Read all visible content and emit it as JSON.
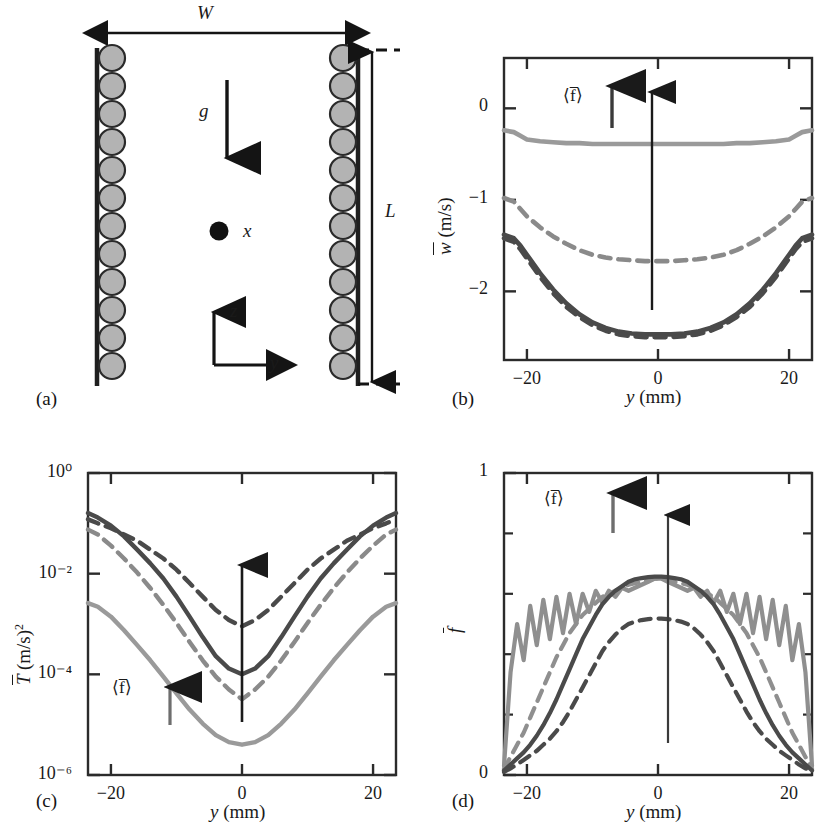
{
  "figure": {
    "panels": [
      {
        "id": "a",
        "label": "(a)"
      },
      {
        "id": "b",
        "label": "(b)"
      },
      {
        "id": "c",
        "label": "(c)"
      },
      {
        "id": "d",
        "label": "(d)"
      }
    ]
  },
  "schematic": {
    "width_label": "W",
    "length_label": "L",
    "gravity_label": "g",
    "axis_x_label": "x",
    "axis_y_label": "y",
    "axis_z_label": "z",
    "wall_particle_count": 12,
    "wall_color": "#b3b3b3",
    "wall_line_color": "#1a1a1a"
  },
  "annotation": {
    "flux_symbol": "⟨f‾⟩",
    "flux_symbol_left": "⟨",
    "flux_symbol_core": "f",
    "flux_symbol_right": "⟩"
  },
  "colors": {
    "dark": "#4a4a4a",
    "mid": "#6e6e6e",
    "light": "#9a9a9a",
    "lighter": "#a8a8a8",
    "axis": "#2b2b2b",
    "arrow": "#111111"
  },
  "chart_data": [
    {
      "panel": "b",
      "type": "line",
      "title": "",
      "xlabel": "y (mm)",
      "ylabel": "w̄ (m/s)",
      "xlim": [
        -23.5,
        23.5
      ],
      "ylim": [
        -2.75,
        0.55
      ],
      "xticks": [
        -20,
        0,
        20
      ],
      "xticklabels": [
        "−20",
        "0",
        "20"
      ],
      "yticks": [
        0,
        -1,
        -2
      ],
      "yticklabels": [
        "0",
        "−1",
        "−2"
      ],
      "grid": false,
      "legend": "none",
      "annotation": "⟨f‾⟩ increases upward",
      "x": [
        -23.5,
        -22,
        -21,
        -20,
        -18,
        -16,
        -14,
        -12,
        -10,
        -8,
        -6,
        -4,
        -2,
        0,
        2,
        4,
        6,
        8,
        10,
        12,
        14,
        16,
        18,
        20,
        21,
        22,
        23.5
      ],
      "series": [
        {
          "name": "lowest flux (light solid)",
          "style": "solid",
          "color": "#9a9a9a",
          "values": [
            -0.24,
            -0.26,
            -0.3,
            -0.34,
            -0.36,
            -0.37,
            -0.38,
            -0.38,
            -0.39,
            -0.39,
            -0.39,
            -0.39,
            -0.39,
            -0.39,
            -0.39,
            -0.39,
            -0.39,
            -0.39,
            -0.39,
            -0.38,
            -0.38,
            -0.37,
            -0.36,
            -0.34,
            -0.3,
            -0.26,
            -0.24
          ]
        },
        {
          "name": "mid flux (light dashed)",
          "style": "dashed",
          "color": "#8a8a8a",
          "values": [
            -0.98,
            -1.02,
            -1.1,
            -1.18,
            -1.3,
            -1.4,
            -1.48,
            -1.55,
            -1.6,
            -1.63,
            -1.65,
            -1.66,
            -1.67,
            -1.67,
            -1.67,
            -1.66,
            -1.65,
            -1.63,
            -1.6,
            -1.55,
            -1.48,
            -1.4,
            -1.3,
            -1.18,
            -1.1,
            -1.02,
            -0.98
          ]
        },
        {
          "name": "high flux (dark solid)",
          "style": "solid",
          "color": "#4a4a4a",
          "values": [
            -1.38,
            -1.42,
            -1.5,
            -1.6,
            -1.8,
            -1.98,
            -2.13,
            -2.25,
            -2.34,
            -2.4,
            -2.44,
            -2.46,
            -2.47,
            -2.47,
            -2.47,
            -2.46,
            -2.44,
            -2.4,
            -2.34,
            -2.25,
            -2.13,
            -1.98,
            -1.8,
            -1.6,
            -1.5,
            -1.42,
            -1.38
          ]
        },
        {
          "name": "highest flux (dark dashed)",
          "style": "dashed",
          "color": "#4a4a4a",
          "values": [
            -1.42,
            -1.46,
            -1.54,
            -1.64,
            -1.84,
            -2.02,
            -2.17,
            -2.28,
            -2.37,
            -2.43,
            -2.47,
            -2.49,
            -2.5,
            -2.5,
            -2.5,
            -2.49,
            -2.47,
            -2.43,
            -2.37,
            -2.28,
            -2.17,
            -2.02,
            -1.84,
            -1.64,
            -1.54,
            -1.46,
            -1.42
          ]
        }
      ]
    },
    {
      "panel": "c",
      "type": "line",
      "title": "",
      "xlabel": "y (mm)",
      "ylabel": "T̄ (m/s)²",
      "yscale": "log",
      "xlim": [
        -23.5,
        23.5
      ],
      "ylim": [
        1e-06,
        1.0
      ],
      "xticks": [
        -20,
        0,
        20
      ],
      "xticklabels": [
        "−20",
        "0",
        "20"
      ],
      "yticks": [
        1.0,
        0.01,
        0.0001,
        1e-06
      ],
      "yticklabels": [
        "10⁰",
        "10⁻²",
        "10⁻⁴",
        "10⁻⁶"
      ],
      "grid": false,
      "legend": "none",
      "annotation": "⟨f‾⟩ increases upward",
      "x": [
        -23.5,
        -22,
        -20,
        -18,
        -16,
        -14,
        -12,
        -10,
        -8,
        -6,
        -4,
        -2,
        0,
        2,
        4,
        6,
        8,
        10,
        12,
        14,
        16,
        18,
        20,
        22,
        23.5
      ],
      "series": [
        {
          "name": "highest flux (dark dashed)",
          "style": "dashed",
          "color": "#4a4a4a",
          "values": [
            0.12,
            0.1,
            0.08,
            0.06,
            0.045,
            0.03,
            0.02,
            0.012,
            0.0065,
            0.0035,
            0.0019,
            0.0012,
            0.0009,
            0.0012,
            0.0019,
            0.0035,
            0.0065,
            0.012,
            0.02,
            0.03,
            0.045,
            0.06,
            0.08,
            0.1,
            0.12
          ]
        },
        {
          "name": "high flux (dark solid)",
          "style": "solid",
          "color": "#4a4a4a",
          "values": [
            0.16,
            0.13,
            0.09,
            0.055,
            0.03,
            0.016,
            0.008,
            0.0035,
            0.0014,
            0.00055,
            0.00023,
            0.00013,
            0.0001,
            0.00013,
            0.00023,
            0.00055,
            0.0014,
            0.0035,
            0.008,
            0.016,
            0.03,
            0.055,
            0.09,
            0.13,
            0.16
          ]
        },
        {
          "name": "mid flux (light dashed)",
          "style": "dashed",
          "color": "#8a8a8a",
          "values": [
            0.075,
            0.06,
            0.036,
            0.02,
            0.0105,
            0.0052,
            0.0024,
            0.00105,
            0.00044,
            0.00019,
            9e-05,
            5e-05,
            3.2e-05,
            5e-05,
            9e-05,
            0.00019,
            0.00044,
            0.00105,
            0.0024,
            0.0052,
            0.0105,
            0.02,
            0.036,
            0.06,
            0.075
          ]
        },
        {
          "name": "lowest flux (light solid)",
          "style": "solid",
          "color": "#9a9a9a",
          "values": [
            0.0026,
            0.0022,
            0.0014,
            0.00075,
            0.00038,
            0.00019,
            9e-05,
            4.2e-05,
            2e-05,
            1.05e-05,
            6.2e-06,
            4.5e-06,
            4e-06,
            4.5e-06,
            6.2e-06,
            1.05e-05,
            2e-05,
            4.2e-05,
            9e-05,
            0.00019,
            0.00038,
            0.00075,
            0.0014,
            0.0022,
            0.0026
          ]
        }
      ]
    },
    {
      "panel": "d",
      "type": "line",
      "title": "",
      "xlabel": "y (mm)",
      "ylabel": "f̄",
      "xlim": [
        -23.5,
        23.5
      ],
      "ylim": [
        0,
        1
      ],
      "xticks": [
        -20,
        0,
        20
      ],
      "xticklabels": [
        "−20",
        "0",
        "20"
      ],
      "yticks": [
        0,
        1
      ],
      "yticklabels": [
        "0",
        "1"
      ],
      "yminorticks": [
        0.2,
        0.4,
        0.6,
        0.8
      ],
      "grid": false,
      "legend": "none",
      "annotation": "⟨f‾⟩ increases upward",
      "x": [
        -23.5,
        -22.5,
        -21.5,
        -20.5,
        -19.5,
        -18.5,
        -17.5,
        -16.5,
        -15.5,
        -14.5,
        -13.5,
        -12.5,
        -11.5,
        -10.5,
        -9.5,
        -8.5,
        -7.5,
        -6.5,
        -5.5,
        -4.5,
        -3.5,
        -2.5,
        -1.5,
        -0.5,
        0.5,
        1.5,
        2.5,
        3.5,
        4.5,
        5.5,
        6.5,
        7.5,
        8.5,
        9.5,
        10.5,
        11.5,
        12.5,
        13.5,
        14.5,
        15.5,
        16.5,
        17.5,
        18.5,
        19.5,
        20.5,
        21.5,
        22.5,
        23.5
      ],
      "series": [
        {
          "name": "lowest flux (light solid, oscillating)",
          "style": "solid",
          "color": "#8f8f8f",
          "values": [
            0.03,
            0.34,
            0.5,
            0.38,
            0.56,
            0.43,
            0.58,
            0.45,
            0.59,
            0.47,
            0.6,
            0.5,
            0.6,
            0.54,
            0.61,
            0.57,
            0.61,
            0.59,
            0.62,
            0.61,
            0.62,
            0.63,
            0.64,
            0.65,
            0.65,
            0.64,
            0.63,
            0.62,
            0.61,
            0.62,
            0.59,
            0.61,
            0.57,
            0.61,
            0.54,
            0.6,
            0.5,
            0.6,
            0.47,
            0.59,
            0.45,
            0.58,
            0.43,
            0.56,
            0.38,
            0.5,
            0.34,
            0.03
          ]
        },
        {
          "name": "mid flux (light dashed)",
          "style": "dashed",
          "color": "#8f8f8f",
          "values": [
            0.02,
            0.06,
            0.1,
            0.14,
            0.19,
            0.24,
            0.29,
            0.34,
            0.39,
            0.43,
            0.47,
            0.5,
            0.53,
            0.55,
            0.57,
            0.59,
            0.6,
            0.61,
            0.62,
            0.63,
            0.635,
            0.64,
            0.645,
            0.65,
            0.65,
            0.645,
            0.64,
            0.635,
            0.63,
            0.62,
            0.61,
            0.6,
            0.59,
            0.57,
            0.55,
            0.53,
            0.5,
            0.47,
            0.43,
            0.39,
            0.34,
            0.29,
            0.24,
            0.19,
            0.14,
            0.1,
            0.06,
            0.02
          ]
        },
        {
          "name": "high flux (dark solid)",
          "style": "solid",
          "color": "#4a4a4a",
          "values": [
            0.015,
            0.035,
            0.055,
            0.075,
            0.1,
            0.13,
            0.165,
            0.205,
            0.25,
            0.3,
            0.35,
            0.4,
            0.45,
            0.49,
            0.53,
            0.565,
            0.59,
            0.61,
            0.625,
            0.64,
            0.648,
            0.652,
            0.655,
            0.657,
            0.657,
            0.655,
            0.652,
            0.648,
            0.64,
            0.625,
            0.61,
            0.59,
            0.565,
            0.53,
            0.49,
            0.45,
            0.4,
            0.35,
            0.3,
            0.25,
            0.205,
            0.165,
            0.13,
            0.1,
            0.075,
            0.055,
            0.035,
            0.015
          ]
        },
        {
          "name": "highest flux (dark dashed)",
          "style": "dashed",
          "color": "#4a4a4a",
          "values": [
            0.01,
            0.022,
            0.035,
            0.05,
            0.065,
            0.08,
            0.1,
            0.12,
            0.145,
            0.175,
            0.21,
            0.25,
            0.29,
            0.33,
            0.37,
            0.41,
            0.44,
            0.465,
            0.485,
            0.5,
            0.508,
            0.513,
            0.516,
            0.518,
            0.518,
            0.516,
            0.513,
            0.508,
            0.5,
            0.485,
            0.465,
            0.44,
            0.41,
            0.37,
            0.33,
            0.29,
            0.25,
            0.21,
            0.175,
            0.145,
            0.12,
            0.1,
            0.08,
            0.065,
            0.05,
            0.035,
            0.022,
            0.01
          ]
        }
      ]
    }
  ]
}
